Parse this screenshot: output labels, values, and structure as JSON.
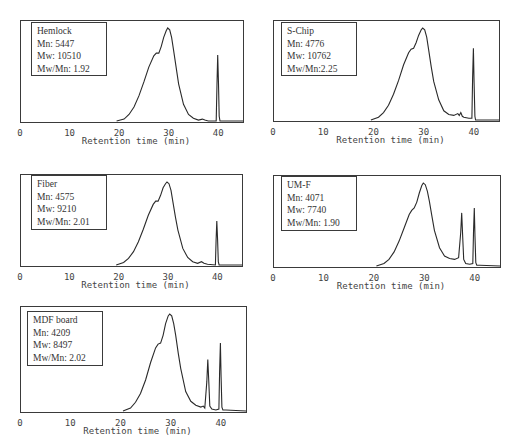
{
  "chart_data": [
    {
      "type": "line",
      "title": "Hemlock",
      "xlabel": "Retention time (min)",
      "ylabel": "",
      "xlim": [
        0,
        45
      ],
      "xticks": [
        0,
        10,
        20,
        30,
        40
      ],
      "legend": [
        "Hemlock",
        "Mn: 5447",
        "Mw: 10510",
        "Mw/Mn: 1.92"
      ],
      "stats": {
        "Mn": 5447,
        "Mw": 10510,
        "Mw_Mn": 1.92
      },
      "frame": {
        "left": 20,
        "top": 20,
        "right": 243,
        "bottom": 122
      },
      "legend_box": {
        "left": 31,
        "top": 22,
        "width": 76,
        "height": 54
      },
      "x": [
        19.5,
        21,
        22,
        23,
        24,
        25,
        26,
        27,
        27.5,
        28,
        28.5,
        29,
        29.5,
        29.8,
        30.2,
        30.6,
        31,
        31.5,
        32,
        33,
        34,
        35,
        36,
        36.8,
        37.3,
        38,
        39.6,
        39.75,
        39.9,
        40.05,
        40.2,
        40.35,
        41,
        45
      ],
      "y": [
        0,
        0.02,
        0.07,
        0.15,
        0.27,
        0.42,
        0.58,
        0.7,
        0.73,
        0.73,
        0.8,
        0.9,
        0.97,
        1.0,
        0.98,
        0.9,
        0.76,
        0.58,
        0.4,
        0.18,
        0.07,
        0.03,
        0.01,
        0.02,
        0.01,
        0,
        0,
        0.4,
        0.71,
        0.4,
        0.05,
        0,
        0,
        0
      ]
    },
    {
      "type": "line",
      "title": "S-Chip",
      "xlabel": "Retention time (min)",
      "ylabel": "",
      "xlim": [
        0,
        45
      ],
      "xticks": [
        0,
        10,
        20,
        30,
        40
      ],
      "legend": [
        "S-Chip",
        "Mn: 4776",
        "Mw: 10762",
        "Mw/Mn:2.25"
      ],
      "stats": {
        "Mn": 4776,
        "Mw": 10762,
        "Mw_Mn": 2.25
      },
      "frame": {
        "left": 273,
        "top": 20,
        "right": 499,
        "bottom": 121
      },
      "legend_box": {
        "left": 281,
        "top": 22,
        "width": 76,
        "height": 54
      },
      "x": [
        19.5,
        21,
        22,
        23,
        24,
        25,
        26,
        27,
        27.5,
        28,
        28.5,
        29,
        29.5,
        29.8,
        30.2,
        30.6,
        31,
        31.5,
        32,
        33,
        34,
        35,
        36,
        36.8,
        37.1,
        37.4,
        37.7,
        38,
        39,
        39.6,
        39.75,
        39.9,
        40.05,
        40.2,
        40.35,
        41,
        45
      ],
      "y": [
        0,
        0.03,
        0.08,
        0.16,
        0.28,
        0.43,
        0.6,
        0.73,
        0.77,
        0.78,
        0.84,
        0.92,
        0.98,
        1.0,
        0.98,
        0.9,
        0.76,
        0.58,
        0.42,
        0.22,
        0.1,
        0.06,
        0.05,
        0.07,
        0.05,
        0.08,
        0.04,
        0.03,
        0.02,
        0.02,
        0.45,
        0.78,
        0.4,
        0.04,
        0,
        0,
        0
      ]
    },
    {
      "type": "line",
      "title": "Fiber",
      "xlabel": "Retention time (min)",
      "ylabel": "",
      "xlim": [
        0,
        45
      ],
      "xticks": [
        0,
        10,
        20,
        30,
        40
      ],
      "legend": [
        "Fiber",
        "Mn: 4575",
        "Mw: 9210",
        "Mw/Mn: 2.01"
      ],
      "stats": {
        "Mn": 4575,
        "Mw": 9210,
        "Mw_Mn": 2.01
      },
      "frame": {
        "left": 20,
        "top": 174,
        "right": 242,
        "bottom": 266
      },
      "legend_box": {
        "left": 31,
        "top": 175,
        "width": 76,
        "height": 55
      },
      "x": [
        19.5,
        21,
        22,
        23,
        24,
        25,
        26,
        27,
        27.5,
        28,
        28.5,
        29,
        29.5,
        29.8,
        30.2,
        30.6,
        31,
        31.5,
        32,
        33,
        34,
        35,
        36,
        36.8,
        37.3,
        38,
        39.6,
        39.75,
        39.9,
        40.05,
        40.2,
        40.35,
        41,
        45
      ],
      "y": [
        0,
        0.03,
        0.08,
        0.16,
        0.28,
        0.43,
        0.6,
        0.73,
        0.77,
        0.77,
        0.84,
        0.93,
        0.98,
        1.0,
        0.98,
        0.9,
        0.76,
        0.58,
        0.42,
        0.2,
        0.09,
        0.04,
        0.02,
        0.04,
        0.02,
        0.01,
        0,
        0.3,
        0.53,
        0.3,
        0.04,
        0,
        0,
        0
      ]
    },
    {
      "type": "line",
      "title": "UM-F",
      "xlabel": "Retention time (min)",
      "ylabel": "",
      "xlim": [
        0,
        45
      ],
      "xticks": [
        0,
        10,
        20,
        30,
        40
      ],
      "legend": [
        "UM-F",
        "Mn: 4071",
        "Mw: 7740",
        "Mw/Mn: 1.90"
      ],
      "stats": {
        "Mn": 4071,
        "Mw": 7740,
        "Mw_Mn": 1.9
      },
      "frame": {
        "left": 273,
        "top": 175,
        "right": 500,
        "bottom": 267
      },
      "legend_box": {
        "left": 281,
        "top": 176,
        "width": 76,
        "height": 55
      },
      "x": [
        20.5,
        22,
        23,
        24,
        25,
        26,
        27,
        27.5,
        28,
        28.5,
        29,
        29.5,
        29.8,
        30.2,
        30.6,
        31,
        31.5,
        32,
        33,
        34,
        35,
        36,
        36.8,
        37.2,
        37.4,
        37.6,
        37.8,
        38.2,
        39,
        39.6,
        39.75,
        39.9,
        40.05,
        40.2,
        40.4,
        41,
        45
      ],
      "y": [
        0,
        0.03,
        0.08,
        0.17,
        0.3,
        0.46,
        0.62,
        0.67,
        0.7,
        0.77,
        0.88,
        0.97,
        1.0,
        0.98,
        0.9,
        0.78,
        0.6,
        0.43,
        0.22,
        0.12,
        0.09,
        0.08,
        0.1,
        0.4,
        0.64,
        0.35,
        0.08,
        0.03,
        0.02,
        0.03,
        0.4,
        0.7,
        0.35,
        0.04,
        0.01,
        0.01,
        0
      ]
    },
    {
      "type": "line",
      "title": "MDF board",
      "xlabel": "Retention time (min)",
      "ylabel": "",
      "xlim": [
        0,
        45
      ],
      "xticks": [
        0,
        10,
        20,
        30,
        40
      ],
      "legend": [
        "MDF board",
        "Mn: 4209",
        "Mw: 8497",
        "Mw/Mn: 2.02"
      ],
      "stats": {
        "Mn": 4209,
        "Mw": 8497,
        "Mw_Mn": 2.02
      },
      "frame": {
        "left": 20,
        "top": 306,
        "right": 246,
        "bottom": 412
      },
      "legend_box": {
        "left": 27,
        "top": 311,
        "width": 76,
        "height": 55
      },
      "x": [
        20.5,
        22,
        23,
        24,
        25,
        26,
        27,
        27.5,
        28,
        28.5,
        29,
        29.5,
        29.8,
        30.2,
        30.6,
        31,
        31.5,
        32,
        33,
        34,
        35,
        36,
        36.5,
        36.8,
        37.2,
        37.4,
        37.6,
        37.8,
        38.2,
        39,
        39.6,
        39.75,
        39.9,
        40.05,
        40.2,
        40.4,
        41,
        45
      ],
      "y": [
        0,
        0.03,
        0.09,
        0.18,
        0.32,
        0.5,
        0.65,
        0.69,
        0.7,
        0.78,
        0.9,
        0.98,
        1.0,
        0.98,
        0.9,
        0.78,
        0.6,
        0.44,
        0.2,
        0.1,
        0.06,
        0.04,
        0.05,
        0.03,
        0.3,
        0.53,
        0.3,
        0.05,
        0.02,
        0.01,
        0.02,
        0.4,
        0.7,
        0.35,
        0.04,
        0.01,
        0.01,
        0
      ]
    }
  ]
}
